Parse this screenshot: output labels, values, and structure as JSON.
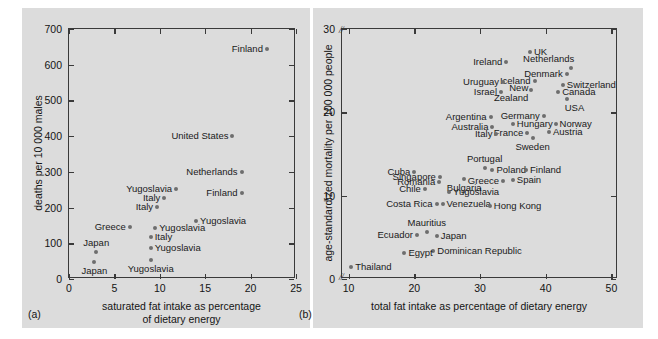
{
  "figure": {
    "background": "#ffffff",
    "panel_background": "#dcdcdc",
    "point_color": "#6e6e6e",
    "axis_color": "#3a3a3a"
  },
  "chart_data": [
    {
      "type": "scatter",
      "panel_tag": "(a)",
      "title": "",
      "xlabel": "saturated fat intake as percentage\nof dietary energy",
      "ylabel": "deaths per 10 000 males",
      "xlim": [
        0,
        25
      ],
      "ylim": [
        0,
        700
      ],
      "xticks": [
        0,
        5,
        10,
        15,
        20,
        25
      ],
      "yticks": [
        0,
        100,
        200,
        300,
        400,
        500,
        600,
        700
      ],
      "grid": false,
      "legend": "none",
      "points": [
        {
          "label": "Finland",
          "x": 21.8,
          "y": 645,
          "lab_side": "left"
        },
        {
          "label": "United States",
          "x": 18.0,
          "y": 400,
          "lab_side": "left"
        },
        {
          "label": "Netherlands",
          "x": 19.0,
          "y": 300,
          "lab_side": "left"
        },
        {
          "label": "Yugoslavia",
          "x": 11.8,
          "y": 253,
          "lab_side": "left"
        },
        {
          "label": "Finland",
          "x": 19.0,
          "y": 240,
          "lab_side": "left"
        },
        {
          "label": "Italy",
          "x": 10.5,
          "y": 228,
          "lab_side": "left"
        },
        {
          "label": "Italy",
          "x": 9.7,
          "y": 203,
          "lab_side": "left"
        },
        {
          "label": "Yugoslavia",
          "x": 14.0,
          "y": 163,
          "lab_side": "right"
        },
        {
          "label": "Greece",
          "x": 6.7,
          "y": 146,
          "lab_side": "left"
        },
        {
          "label": "Yugoslavia",
          "x": 9.5,
          "y": 143,
          "lab_side": "right"
        },
        {
          "label": "Italy",
          "x": 9.0,
          "y": 118,
          "lab_side": "right"
        },
        {
          "label": "Yugoslavia",
          "x": 9.0,
          "y": 86,
          "lab_side": "right"
        },
        {
          "label": "Japan",
          "x": 3.0,
          "y": 77,
          "lab_side": "top"
        },
        {
          "label": "Yugoslavia",
          "x": 9.0,
          "y": 52,
          "lab_side": "bottom"
        },
        {
          "label": "Japan",
          "x": 2.8,
          "y": 47,
          "lab_side": "bottom"
        }
      ]
    },
    {
      "type": "scatter",
      "panel_tag": "(b)",
      "title": "",
      "xlabel": "total fat intake as percentage of dietary energy",
      "ylabel": "age-standardized mortality per 100 000 people",
      "xlim": [
        9,
        51
      ],
      "ylim": [
        0,
        30
      ],
      "xticks": [
        10,
        20,
        30,
        40,
        50
      ],
      "yticks": [
        0,
        10,
        20,
        30
      ],
      "axis_break_y": [
        "0",
        "30"
      ],
      "grid": false,
      "legend": "none",
      "points": [
        {
          "label": "UK",
          "x": 37.6,
          "y": 27.3,
          "lab_side": "right"
        },
        {
          "label": "Ireland",
          "x": 34.0,
          "y": 26.1,
          "lab_side": "left"
        },
        {
          "label": "Netherlands",
          "x": 43.9,
          "y": 25.3,
          "lab_side": "top-left"
        },
        {
          "label": "Denmark",
          "x": 43.2,
          "y": 24.6,
          "lab_side": "left"
        },
        {
          "label": "Iceland",
          "x": 38.3,
          "y": 23.8,
          "lab_side": "left"
        },
        {
          "label": "Uruguay",
          "x": 33.5,
          "y": 23.6,
          "lab_side": "left"
        },
        {
          "label": "Switzerland",
          "x": 42.6,
          "y": 23.3,
          "lab_side": "right"
        },
        {
          "label": "Canada",
          "x": 41.9,
          "y": 22.5,
          "lab_side": "right"
        },
        {
          "label": "New\nZealand",
          "x": 37.8,
          "y": 22.7,
          "lab_side": "left-two"
        },
        {
          "label": "Israel",
          "x": 33.2,
          "y": 22.4,
          "lab_side": "left"
        },
        {
          "label": "USA",
          "x": 43.2,
          "y": 21.6,
          "lab_side": "bottom-right"
        },
        {
          "label": "Germany",
          "x": 39.7,
          "y": 19.6,
          "lab_side": "left"
        },
        {
          "label": "Argentina",
          "x": 31.6,
          "y": 19.5,
          "lab_side": "left"
        },
        {
          "label": "Norway",
          "x": 41.5,
          "y": 18.6,
          "lab_side": "right"
        },
        {
          "label": "Hungary",
          "x": 35.0,
          "y": 18.6,
          "lab_side": "right"
        },
        {
          "label": "Australia",
          "x": 31.9,
          "y": 18.3,
          "lab_side": "left"
        },
        {
          "label": "Austria",
          "x": 40.5,
          "y": 17.6,
          "lab_side": "right"
        },
        {
          "label": "France",
          "x": 37.2,
          "y": 17.5,
          "lab_side": "left"
        },
        {
          "label": "Italy",
          "x": 32.5,
          "y": 17.4,
          "lab_side": "left"
        },
        {
          "label": "Sweden",
          "x": 38.0,
          "y": 16.9,
          "lab_side": "bottom"
        },
        {
          "label": "Portugal",
          "x": 30.7,
          "y": 13.3,
          "lab_side": "top"
        },
        {
          "label": "Poland",
          "x": 31.9,
          "y": 13.1,
          "lab_side": "right"
        },
        {
          "label": "Finland",
          "x": 37.0,
          "y": 13.1,
          "lab_side": "right"
        },
        {
          "label": "Cuba",
          "x": 20.0,
          "y": 12.9,
          "lab_side": "left"
        },
        {
          "label": "Singapore",
          "x": 23.9,
          "y": 12.3,
          "lab_side": "left"
        },
        {
          "label": "Spain",
          "x": 35.0,
          "y": 11.9,
          "lab_side": "right"
        },
        {
          "label": "Greece",
          "x": 33.5,
          "y": 11.8,
          "lab_side": "left"
        },
        {
          "label": "Bulgaria",
          "x": 27.6,
          "y": 12.0,
          "lab_side": "bottom"
        },
        {
          "label": "Romania",
          "x": 23.8,
          "y": 11.6,
          "lab_side": "left"
        },
        {
          "label": "Chile",
          "x": 21.6,
          "y": 10.8,
          "lab_side": "left"
        },
        {
          "label": "Yugoslavia",
          "x": 25.3,
          "y": 10.5,
          "lab_side": "right"
        },
        {
          "label": "Venezuela",
          "x": 24.3,
          "y": 9.0,
          "lab_side": "right"
        },
        {
          "label": "Costa Rica",
          "x": 23.4,
          "y": 9.0,
          "lab_side": "left"
        },
        {
          "label": "Hong Kong",
          "x": 31.5,
          "y": 8.8,
          "lab_side": "right"
        },
        {
          "label": "Mauritius",
          "x": 21.9,
          "y": 5.7,
          "lab_side": "top"
        },
        {
          "label": "Ecuador",
          "x": 20.4,
          "y": 5.3,
          "lab_side": "left"
        },
        {
          "label": "Japan",
          "x": 23.4,
          "y": 5.2,
          "lab_side": "right"
        },
        {
          "label": "Dominican Republic",
          "x": 22.9,
          "y": 3.4,
          "lab_side": "right"
        },
        {
          "label": "Egypt",
          "x": 18.5,
          "y": 3.1,
          "lab_side": "right"
        },
        {
          "label": "Thailand",
          "x": 10.4,
          "y": 1.4,
          "lab_side": "right"
        }
      ]
    }
  ]
}
